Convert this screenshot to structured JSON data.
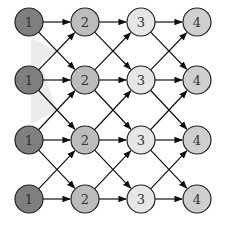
{
  "diagram": {
    "type": "lattice-graph",
    "shade_color": "#ebebeb",
    "node_radius": 14,
    "column_x": [
      29,
      85,
      141,
      197
    ],
    "row_y": [
      22,
      80,
      140,
      199
    ],
    "column_fills": [
      "#7f7f7f",
      "#bcbcbc",
      "#e6e6e6",
      "#cfcfcf"
    ],
    "stroke": "#222222",
    "rows": [
      {
        "labels": [
          "1",
          "2",
          "3",
          "4"
        ]
      },
      {
        "labels": [
          "1",
          "2",
          "3",
          "4"
        ]
      },
      {
        "labels": [
          "1",
          "2",
          "3",
          "4"
        ]
      },
      {
        "labels": [
          "1",
          "2",
          "3",
          "4"
        ]
      }
    ],
    "edges": "each node at column c connects to column c+1 in the same row (horizontal) and diagonally to adjacent rows above and below"
  }
}
